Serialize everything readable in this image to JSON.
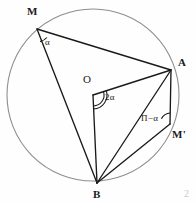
{
  "figure": {
    "canvas": {
      "width": 196,
      "height": 203
    },
    "colors": {
      "background": "#fefefe",
      "circle_stroke": "#8e8e8e",
      "chord_stroke": "#1a1a1a",
      "label_color": "#1a1a1a",
      "faint_artifact": "#c9c9c9"
    },
    "circle": {
      "cx": 93,
      "cy": 95,
      "r": 86
    },
    "points": {
      "M": {
        "x": 37,
        "y": 29,
        "label": "M"
      },
      "A": {
        "x": 171,
        "y": 70,
        "label": "A"
      },
      "B": {
        "x": 97,
        "y": 183,
        "label": "B"
      },
      "M_prime": {
        "x": 170,
        "y": 124,
        "label": "M'"
      },
      "O": {
        "x": 93,
        "y": 95,
        "label": "O"
      }
    },
    "label_positions": {
      "M": {
        "x": 27,
        "y": 6
      },
      "A": {
        "x": 178,
        "y": 57
      },
      "B": {
        "x": 93,
        "y": 189
      },
      "M_prime": {
        "x": 172,
        "y": 129
      },
      "O": {
        "x": 83,
        "y": 74
      },
      "alpha": {
        "x": 45,
        "y": 38
      },
      "two_alpha": {
        "x": 105,
        "y": 93
      },
      "pi_minus_alpha": {
        "x": 141,
        "y": 114
      },
      "corner_artifact": {
        "x": 184,
        "y": 189
      }
    },
    "angle_labels": {
      "alpha": "α",
      "two_alpha": "2α",
      "pi_minus_alpha": "П−α",
      "corner_artifact": "2"
    },
    "segments": [
      {
        "name": "chord-M-A",
        "from": "M",
        "to": "A"
      },
      {
        "name": "chord-M-B",
        "from": "M",
        "to": "B"
      },
      {
        "name": "radius-O-A",
        "from": "O",
        "to": "A"
      },
      {
        "name": "radius-O-B",
        "from": "O",
        "to": "B"
      },
      {
        "name": "chord-A-B",
        "from": "A",
        "to": "B"
      },
      {
        "name": "chord-A-Mprime",
        "from": "A",
        "to": "M_prime"
      },
      {
        "name": "chord-Mprime-B",
        "from": "M_prime",
        "to": "B"
      }
    ],
    "arcs": {
      "alpha_at_M": {
        "vertex": "M",
        "radius": 13,
        "count": 1
      },
      "two_alpha_at_O": {
        "vertex": "O",
        "radius": 11,
        "count": 2
      },
      "pi_minus_alpha_at_Mprime": {
        "vertex": "M_prime",
        "radius": 11,
        "count": 1
      }
    }
  }
}
